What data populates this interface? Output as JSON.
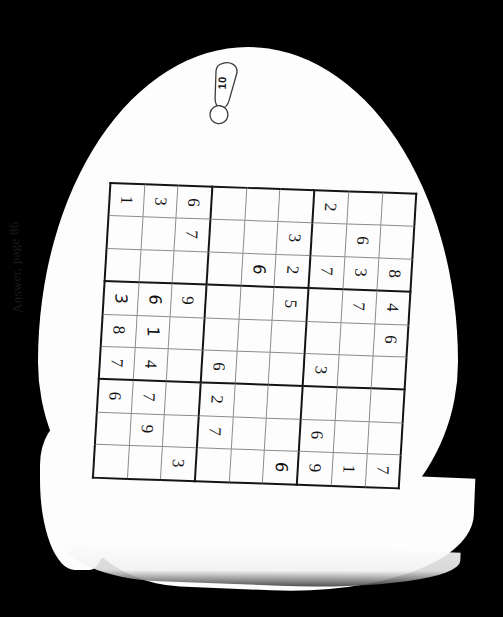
{
  "page": {
    "background_color": "#000000",
    "paper_color": "#fdfdfd",
    "ink_color": "#141414"
  },
  "tag": {
    "name": "puzzle-number-tag",
    "number": "10"
  },
  "answer_reference": {
    "text": "Answer, page 86"
  },
  "puzzle": {
    "type": "sudoku",
    "size": 9,
    "orientation_note": "grid rendered rotated; digits read sideways",
    "rows": [
      [
        "1",
        "3",
        "6",
        "",
        "",
        "",
        "2",
        "",
        ""
      ],
      [
        "",
        "",
        "7",
        "",
        "",
        "3",
        "",
        "6",
        ""
      ],
      [
        "",
        "",
        "",
        "",
        "6",
        "2",
        "7",
        "3",
        "8"
      ],
      [
        "3",
        "6",
        "9",
        "",
        "",
        "5",
        "",
        "7",
        "4"
      ],
      [
        "8",
        "1",
        "",
        "",
        "",
        "",
        "",
        "",
        "6"
      ],
      [
        "7",
        "4",
        "",
        "6",
        "",
        "",
        "3",
        "",
        ""
      ],
      [
        "6",
        "7",
        "",
        "2",
        "",
        "",
        "",
        "",
        ""
      ],
      [
        "",
        "9",
        "",
        "7",
        "",
        "",
        "6",
        "",
        ""
      ],
      [
        "",
        "",
        "3",
        "",
        "",
        "6",
        "9",
        "1",
        "7"
      ]
    ],
    "handwritten_cells": [
      [
        2,
        4
      ],
      [
        3,
        0
      ],
      [
        3,
        1
      ],
      [
        4,
        1
      ],
      [
        8,
        5
      ]
    ]
  }
}
